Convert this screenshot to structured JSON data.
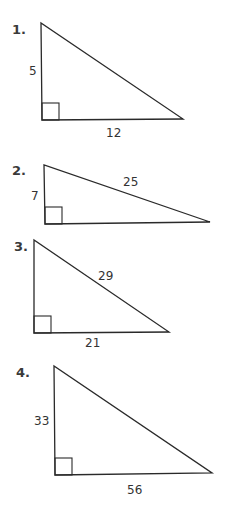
{
  "problems": [
    {
      "number": "1.",
      "labels": {
        "vertical_leg": "5",
        "horizontal_leg": "12"
      },
      "geom": {
        "top": [
          41,
          23
        ],
        "corner": [
          42,
          120
        ],
        "right": [
          183,
          119
        ]
      },
      "label_pos": {
        "number": [
          12,
          34
        ],
        "vertical_leg": [
          29,
          75
        ],
        "horizontal_leg": [
          106,
          137
        ]
      }
    },
    {
      "number": "2.",
      "labels": {
        "vertical_leg": "7",
        "hypotenuse": "25"
      },
      "geom": {
        "top": [
          44,
          165
        ],
        "corner": [
          45,
          224
        ],
        "right": [
          210,
          222
        ]
      },
      "label_pos": {
        "number": [
          12,
          175
        ],
        "vertical_leg": [
          31,
          200
        ],
        "hypotenuse": [
          123,
          186
        ]
      }
    },
    {
      "number": "3.",
      "labels": {
        "hypotenuse": "29",
        "horizontal_leg": "21"
      },
      "geom": {
        "top": [
          34,
          240
        ],
        "corner": [
          34,
          333
        ],
        "right": [
          169,
          332
        ]
      },
      "label_pos": {
        "number": [
          14,
          251
        ],
        "hypotenuse": [
          98,
          280
        ],
        "horizontal_leg": [
          85,
          347
        ]
      }
    },
    {
      "number": "4.",
      "labels": {
        "vertical_leg": "33",
        "horizontal_leg": "56"
      },
      "geom": {
        "top": [
          54,
          366
        ],
        "corner": [
          55,
          475
        ],
        "right": [
          212,
          473
        ]
      },
      "label_pos": {
        "number": [
          16,
          377
        ],
        "vertical_leg": [
          34,
          425
        ],
        "horizontal_leg": [
          127,
          494
        ]
      }
    }
  ],
  "square_size": 17
}
